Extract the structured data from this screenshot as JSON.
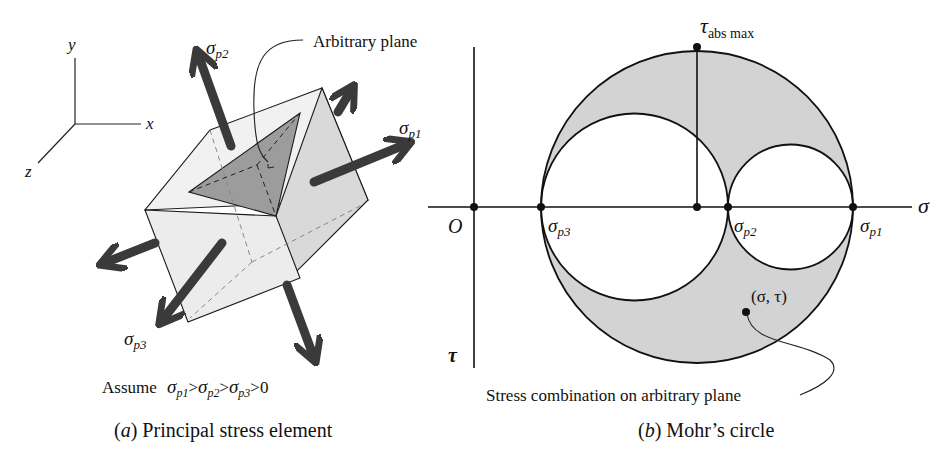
{
  "panel_a": {
    "axes": {
      "y": "y",
      "x": "x",
      "z": "z"
    },
    "labels": {
      "arbitrary_plane": "Arbitrary plane",
      "sigma": "σ",
      "sub_p1": "p1",
      "sub_p2": "p2",
      "sub_p3": "p3"
    },
    "assume": {
      "prefix": "Assume",
      "gt": ">",
      "zero": "0"
    },
    "caption": {
      "letter": "a",
      "text": "Principal stress element"
    }
  },
  "panel_b": {
    "axes": {
      "origin": "O",
      "sigma": "σ",
      "tau": "τ"
    },
    "labels": {
      "tau": "τ",
      "abs_max": "abs max",
      "sigma": "σ",
      "sub_p1": "p1",
      "sub_p2": "p2",
      "sub_p3": "p3",
      "point": "(σ, τ)",
      "callout": "Stress combination on arbitrary plane"
    },
    "caption": {
      "letter": "b",
      "text": "Mohr’s circle"
    },
    "colors": {
      "shade": "#d3d3d3",
      "line": "#111111"
    }
  }
}
